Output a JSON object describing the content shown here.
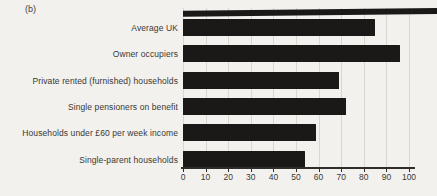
{
  "figure_label": "(b)",
  "chart_data": {
    "type": "bar",
    "orientation": "horizontal",
    "title": "",
    "xlabel": "",
    "ylabel": "",
    "categories": [
      "Average UK",
      "Owner occupiers",
      "Private rented (furnished) households",
      "Single pensioners on benefit",
      "Households under £60 per week income",
      "Single-parent households"
    ],
    "values": [
      85,
      96,
      69,
      72,
      59,
      54
    ],
    "xlim": [
      0,
      100
    ],
    "x_ticks": [
      0,
      10,
      20,
      30,
      40,
      50,
      60,
      70,
      80,
      90,
      100
    ],
    "grid": "vertical",
    "legend": "none"
  },
  "artifacts": {
    "partial_bar_from_panel_above_visible_at_top": true
  },
  "style": {
    "background": "#f2f1ed",
    "bar_color": "#1a1917",
    "grid_color": "#d9d6d0",
    "axis_color": "#2f2d29",
    "text_color": "#3a3835"
  }
}
